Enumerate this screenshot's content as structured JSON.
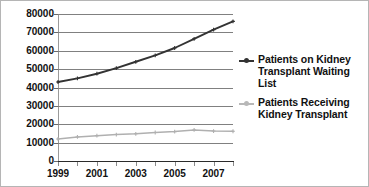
{
  "chart_data": {
    "type": "line",
    "title": "",
    "xlabel": "",
    "ylabel": "",
    "x": [
      1999,
      2000,
      2001,
      2002,
      2003,
      2004,
      2005,
      2006,
      2007,
      2008
    ],
    "x_tick_labels": [
      "1999",
      "2001",
      "2003",
      "2005",
      "2007"
    ],
    "x_tick_values": [
      1999,
      2001,
      2003,
      2005,
      2007
    ],
    "y_tick_labels": [
      "80000",
      "70000",
      "60000",
      "50000",
      "40000",
      "30000",
      "20000",
      "10000",
      "0"
    ],
    "y_tick_values": [
      80000,
      70000,
      60000,
      50000,
      40000,
      30000,
      20000,
      10000,
      0
    ],
    "ylim": [
      0,
      80000
    ],
    "xlim": [
      1999,
      2008
    ],
    "grid": true,
    "legend_position": "right",
    "series": [
      {
        "name": "Patients on Kidney Transplant Waiting List",
        "color": "#333333",
        "marker": "cross",
        "values": [
          43000,
          45000,
          47500,
          50500,
          54000,
          57500,
          61500,
          66500,
          71500,
          76000
        ]
      },
      {
        "name": "Patients Receiving Kidney Transplant",
        "color": "#b0b0b0",
        "marker": "cross",
        "values": [
          12000,
          13100,
          13800,
          14400,
          14800,
          15500,
          16000,
          16900,
          16300,
          16200
        ]
      }
    ]
  },
  "legend": {
    "entries": [
      {
        "label": "Patients on Kidney Transplant Waiting List",
        "color": "#333333"
      },
      {
        "label": "Patients Receiving Kidney Transplant",
        "color": "#b8b8b8"
      }
    ]
  }
}
